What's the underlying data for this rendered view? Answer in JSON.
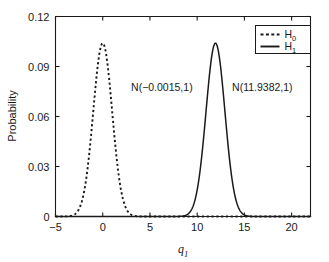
{
  "chart_data": {
    "type": "line",
    "title": "",
    "xlabel": "q1",
    "xlabel_base": "q",
    "xlabel_sub": "1",
    "ylabel": "Probability",
    "xlim": [
      -5,
      22
    ],
    "ylim": [
      0,
      0.12
    ],
    "grid": false,
    "xticks": [
      -5,
      0,
      5,
      10,
      15,
      20
    ],
    "xtick_labels": [
      "−5",
      "0",
      "5",
      "10",
      "15",
      "20"
    ],
    "yticks": [
      0,
      0.03,
      0.06,
      0.09,
      0.12
    ],
    "ytick_labels": [
      "0",
      "0.03",
      "0.06",
      "0.09",
      "0.12"
    ],
    "legend_position": "upper right",
    "series": [
      {
        "name": "H0",
        "label_base": "H",
        "label_sub": "0",
        "style": "dashed",
        "color": "#1a1a1a",
        "distribution": "normal",
        "mean": -0.0015,
        "sigma": 1,
        "peak_value": 0.104,
        "annotation": "N(−0.0015,1)",
        "annotation_x": 3.0,
        "annotation_y": 0.0755
      },
      {
        "name": "H1",
        "label_base": "H",
        "label_sub": "1",
        "style": "solid",
        "color": "#1a1a1a",
        "distribution": "normal",
        "mean": 11.9382,
        "sigma": 1,
        "peak_value": 0.104,
        "annotation": "N(11.9382,1)",
        "annotation_x": 13.7,
        "annotation_y": 0.0755
      }
    ]
  },
  "figure": {
    "background_color": "#ffffff",
    "axis_color": "#1a1a1a",
    "text_color": "#1a1a1a"
  }
}
